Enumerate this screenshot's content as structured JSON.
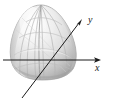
{
  "figure": {
    "kind": "3d-surface-plot",
    "axes": [
      {
        "name": "x-axis",
        "label": "x",
        "orientation": "horizontal",
        "arrow": "right",
        "start": [
          3,
          60
        ],
        "end": [
          101,
          60
        ],
        "label_position": [
          95,
          63
        ]
      },
      {
        "name": "y-axis",
        "label": "y",
        "orientation": "diagonal",
        "arrow": "upper-right",
        "start": [
          22,
          98
        ],
        "end": [
          82,
          19
        ],
        "label_position": [
          88,
          15
        ]
      }
    ],
    "surface": {
      "name": "egg-surface",
      "silhouette": "rounded teardrop / ovoid, narrow at top, broad rounded base",
      "bounds": {
        "left": 11,
        "top": 5,
        "right": 78,
        "bottom": 80
      },
      "mesh": "longitude meridians and latitude parallels"
    },
    "colors": {
      "background": "#ffffff",
      "axis": "#1a1a1a",
      "label": "#1a1a1a",
      "surface_light": "#f4f4f4",
      "surface_mid": "#d8d8d8",
      "surface_shadow": "#a8a8a8",
      "surface_highlight": "#fdfdfd",
      "mesh_line": "#b4b4b4",
      "outline": "#9a9a9a"
    }
  }
}
